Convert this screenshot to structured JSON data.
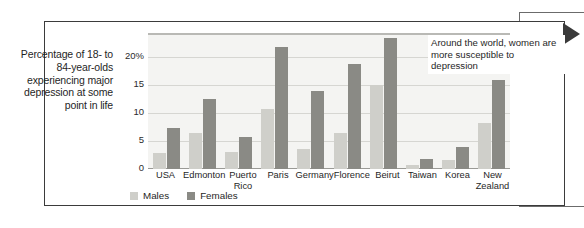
{
  "caption": "Percentage of 18- to 84-year-olds experiencing major depression at some point in life",
  "annotation": "Around the world, women are more susceptible to depression",
  "legend": {
    "males_label": "Males",
    "females_label": "Females"
  },
  "colors": {
    "males": "#cfcfca",
    "females": "#8a8a85",
    "plot_background": "#f4f4f2",
    "gridline": "#d6d6d2",
    "frame": "#3b3b3b",
    "arrow": "#3a3a3a"
  },
  "chart_data": {
    "type": "bar",
    "title": "",
    "subtitle": "",
    "xlabel": "",
    "ylabel": "Percentage of 18- to 84-year-olds experiencing major depression at some point in life",
    "ylim": [
      0,
      24
    ],
    "yticks": [
      0,
      5,
      10,
      15,
      20
    ],
    "ytick_labels": [
      "0",
      "5",
      "10",
      "15",
      "20%"
    ],
    "grid": true,
    "legend_position": "bottom-left",
    "categories": [
      "USA",
      "Edmonton",
      "Puerto\nRico",
      "Paris",
      "Germany",
      "Florence",
      "Beirut",
      "Taiwan",
      "Korea",
      "New\nZealand"
    ],
    "series": [
      {
        "name": "Males",
        "color": "#cfcfca",
        "values": [
          2.8,
          6.5,
          3.0,
          10.8,
          3.5,
          6.5,
          15.0,
          0.8,
          1.7,
          8.3
        ]
      },
      {
        "name": "Females",
        "color": "#8a8a85",
        "values": [
          7.3,
          12.5,
          5.7,
          21.8,
          13.9,
          18.8,
          23.5,
          1.8,
          4.0,
          16.0
        ]
      }
    ],
    "annotations": [
      {
        "text": "Around the world, women are more susceptible to depression",
        "position": "top-right"
      }
    ]
  }
}
